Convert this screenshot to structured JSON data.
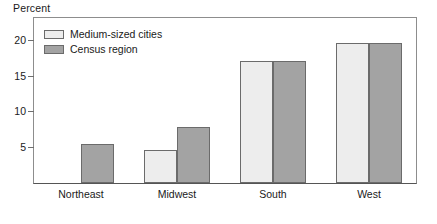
{
  "chart_data": {
    "type": "bar",
    "title": "",
    "subtitle": "",
    "xlabel": "",
    "ylabel": "Percent",
    "categories": [
      "Northeast",
      "Midwest",
      "South",
      "West"
    ],
    "series": [
      {
        "name": "Medium-sized cities",
        "color": "#ededed",
        "border_color": "#6b6b6b",
        "values": [
          null,
          4.6,
          17.1,
          19.5
        ]
      },
      {
        "name": "Census region",
        "color": "#a3a3a3",
        "border_color": "#6b6b6b",
        "values": [
          5.5,
          7.8,
          17.1,
          19.6
        ]
      }
    ],
    "ylim": [
      0,
      23.2
    ],
    "yticks": [
      5,
      10,
      15,
      20
    ],
    "ytick_labels": [
      "5",
      "10",
      "15",
      "20"
    ],
    "grid": false,
    "legend_position": "top-left-inside",
    "orientation": "vertical",
    "group_mode": "grouped"
  },
  "axis": {
    "unit_title": "Percent"
  },
  "legend": {
    "items": [
      {
        "label": "Medium-sized cities",
        "swatch_color": "#ededed"
      },
      {
        "label": "Census region",
        "swatch_color": "#a3a3a3"
      }
    ]
  },
  "colors": {
    "series_light": "#ededed",
    "series_gray": "#a3a3a3",
    "bar_border": "#6b6b6b",
    "axis_line": "#555555",
    "frame_line": "#8d8d8d",
    "text": "#1a1a1a",
    "background": "#ffffff"
  }
}
